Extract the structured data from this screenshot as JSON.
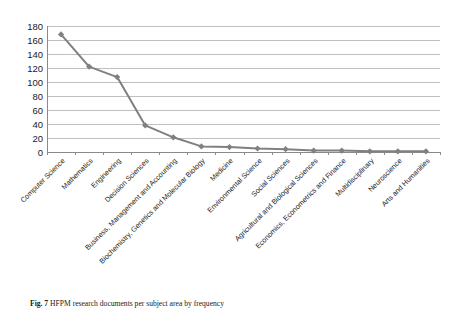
{
  "figure": {
    "caption_label": "Fig. 7",
    "caption_text": "HFPM research documents per subject area by frequency"
  },
  "axis": {
    "y_ticks": [
      "0",
      "20",
      "40",
      "60",
      "80",
      "100",
      "120",
      "140",
      "160",
      "180"
    ]
  },
  "colors": {
    "series": "#808080",
    "gridline": "#bfbfbf",
    "axis": "#8a8a8a",
    "text": "#1a1a1a"
  },
  "chart_data": {
    "type": "line",
    "title": "",
    "xlabel": "",
    "ylabel": "",
    "ylim": [
      0,
      180
    ],
    "ytick_step": 20,
    "grid": true,
    "legend": "none",
    "marker": "diamond",
    "categories": [
      "Computer Science",
      "Mathematics",
      "Engineering",
      "Decision Sciences",
      "Business, Management and Accounting",
      "Biochemistry, Genetics and Molecular Biology",
      "Medicine",
      "Environmental Science",
      "Social Sciences",
      "Agricultural and Biological Sciences",
      "Economics, Econometrics and Finance",
      "Multidisciplinary",
      "Neuroscience",
      "Arts and Humanities"
    ],
    "values": [
      168,
      122,
      107,
      38,
      21,
      8,
      7,
      5,
      4,
      2,
      2,
      1,
      1,
      1
    ]
  }
}
